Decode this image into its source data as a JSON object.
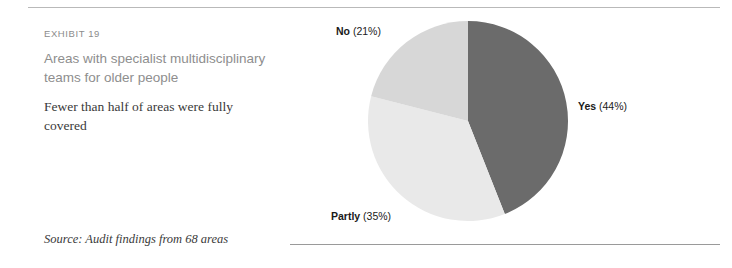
{
  "exhibit": {
    "label": "EXHIBIT 19",
    "title": "Areas with specialist multidisciplinary teams for older people",
    "subtitle": "Fewer than half of areas were fully covered",
    "source": "Source: Audit findings from 68 areas"
  },
  "chart_data": {
    "type": "pie",
    "title": "Areas with specialist multidisciplinary teams for older people",
    "subtitle": "Fewer than half of areas were fully covered",
    "categories": [
      "Yes",
      "Partly",
      "No"
    ],
    "values": [
      44,
      35,
      21
    ],
    "unit": "%",
    "total_n": 68,
    "source": "Source: Audit findings from 68 areas",
    "legend_position": "labels-outside",
    "start_angle_deg": 0,
    "direction": "clockwise",
    "slices": [
      {
        "name": "Yes",
        "value": 44,
        "label": "Yes (44%)",
        "name_text": "Yes",
        "pct_text": "(44%)",
        "color": "#6b6b6b"
      },
      {
        "name": "Partly",
        "value": 35,
        "label": "Partly (35%)",
        "name_text": "Partly",
        "pct_text": "(35%)",
        "color": "#e9e9e9"
      },
      {
        "name": "No",
        "value": 21,
        "label": "No (21%)",
        "name_text": "No",
        "pct_text": "(21%)",
        "color": "#d7d7d7"
      }
    ]
  },
  "colors": {
    "yes": "#6b6b6b",
    "partly": "#e9e9e9",
    "no": "#d7d7d7",
    "rule_top": "#b9b9b9",
    "rule_bottom": "#9a9a9a",
    "title_text": "#8e8e8e",
    "body_text": "#3a3a3a"
  }
}
